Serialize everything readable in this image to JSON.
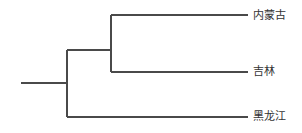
{
  "diagram": {
    "type": "dendrogram",
    "orientation": "left-to-right",
    "leaves": [
      {
        "id": "nmg",
        "label": "内蒙古"
      },
      {
        "id": "jl",
        "label": "吉林"
      },
      {
        "id": "hlj",
        "label": "黑龙江"
      }
    ],
    "tree": {
      "children": [
        {
          "children": [
            {
              "leaf": "nmg"
            },
            {
              "leaf": "jl"
            }
          ]
        },
        {
          "leaf": "hlj"
        }
      ]
    },
    "colors": {
      "line": "#4a4a4a",
      "text": "#333333"
    }
  }
}
